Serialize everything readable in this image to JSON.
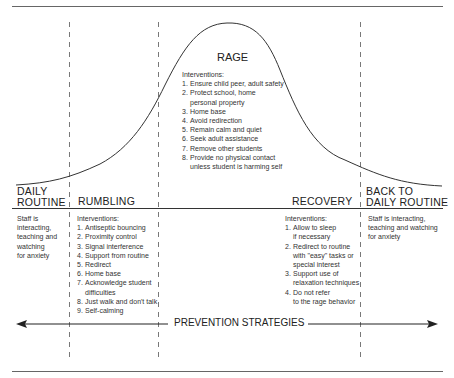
{
  "diagram": {
    "phases": [
      {
        "key": "daily_routine",
        "title_lines": [
          "DAILY",
          "ROUTINE"
        ],
        "description": [
          "Staff is",
          "interacting,",
          "teaching and",
          "watching",
          "for anxiety"
        ]
      },
      {
        "key": "rumbling",
        "title_lines": [
          "RUMBLING"
        ],
        "interventions_header": "Interventions:",
        "interventions": [
          {
            "num": "1.",
            "lines": [
              "Antiseptic bouncing"
            ]
          },
          {
            "num": "2.",
            "lines": [
              "Proximity control"
            ]
          },
          {
            "num": "3.",
            "lines": [
              "Signal interference"
            ]
          },
          {
            "num": "4.",
            "lines": [
              "Support from routine"
            ]
          },
          {
            "num": "5.",
            "lines": [
              "Redirect"
            ]
          },
          {
            "num": "6.",
            "lines": [
              "Home base"
            ]
          },
          {
            "num": "7.",
            "lines": [
              "Acknowledge student",
              "difficulties"
            ]
          },
          {
            "num": "8.",
            "lines": [
              "Just walk and don't talk"
            ]
          },
          {
            "num": "9.",
            "lines": [
              "Self-calming"
            ]
          }
        ]
      },
      {
        "key": "rage",
        "title_lines": [
          "RAGE"
        ],
        "interventions_header": "Interventions:",
        "interventions": [
          {
            "num": "1.",
            "lines": [
              "Ensure child peer, adult safety"
            ]
          },
          {
            "num": "2.",
            "lines": [
              "Protect school, home",
              "personal property"
            ]
          },
          {
            "num": "3.",
            "lines": [
              "Home base"
            ]
          },
          {
            "num": "4.",
            "lines": [
              "Avoid redirection"
            ]
          },
          {
            "num": "5.",
            "lines": [
              "Remain calm and quiet"
            ]
          },
          {
            "num": "6.",
            "lines": [
              "Seek adult assistance"
            ]
          },
          {
            "num": "7.",
            "lines": [
              "Remove other students"
            ]
          },
          {
            "num": "8.",
            "lines": [
              "Provide no physical contact",
              "unless student is harming self"
            ]
          }
        ]
      },
      {
        "key": "recovery",
        "title_lines": [
          "RECOVERY"
        ],
        "interventions_header": "Interventions:",
        "interventions": [
          {
            "num": "1.",
            "lines": [
              "Allow to sleep",
              "if necessary"
            ]
          },
          {
            "num": "2.",
            "lines": [
              "Redirect to routine",
              "with \"easy\" tasks or",
              "special interest"
            ]
          },
          {
            "num": "3.",
            "lines": [
              "Support use of",
              "relaxation techniques"
            ]
          },
          {
            "num": "4.",
            "lines": [
              "Do not refer",
              "to the rage behavior"
            ]
          }
        ]
      },
      {
        "key": "back_to_daily_routine",
        "title_lines": [
          "BACK TO",
          "DAILY ROUTINE"
        ],
        "description": [
          "Staff is interacting,",
          "teaching and watching",
          "for anxiety"
        ]
      }
    ],
    "prevention_label": "PREVENTION STRATEGIES",
    "colors": {
      "line": "#333333",
      "text": "#222222",
      "rule": "#555555"
    }
  }
}
